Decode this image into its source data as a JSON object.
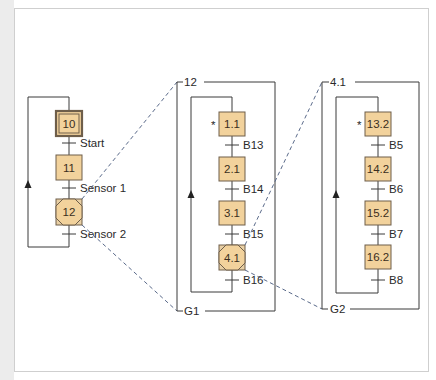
{
  "colors": {
    "step_fill": "#f2d29c",
    "step_border": "#6e5e4a",
    "line": "#3a3a3a",
    "dash": "#5a6a8a"
  },
  "main_chart": {
    "steps": [
      {
        "id": "10",
        "type": "initial"
      },
      {
        "id": "11",
        "type": "normal"
      },
      {
        "id": "12",
        "type": "macro"
      }
    ],
    "transitions": [
      "Start",
      "Sensor 1",
      "Sensor 2"
    ]
  },
  "macro_12": {
    "entry_label": "12",
    "exit_label": "G1",
    "steps": [
      {
        "id": "1.1",
        "type": "entry",
        "marker": "*"
      },
      {
        "id": "2.1",
        "type": "normal"
      },
      {
        "id": "3.1",
        "type": "normal"
      },
      {
        "id": "4.1",
        "type": "macro"
      }
    ],
    "transitions": [
      "B13",
      "B14",
      "B15",
      "B16"
    ]
  },
  "macro_4_1": {
    "entry_label": "4.1",
    "exit_label": "G2",
    "steps": [
      {
        "id": "13.2",
        "type": "entry",
        "marker": "*"
      },
      {
        "id": "14.2",
        "type": "normal"
      },
      {
        "id": "15.2",
        "type": "normal"
      },
      {
        "id": "16.2",
        "type": "normal"
      }
    ],
    "transitions": [
      "B5",
      "B6",
      "B7",
      "B8"
    ]
  }
}
